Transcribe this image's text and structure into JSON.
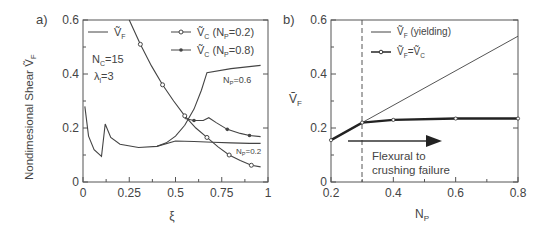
{
  "chart_data": [
    {
      "panel": "a)",
      "type": "line",
      "xlabel": "ξ",
      "ylabel": "Nondimesional Shear Ṽ_F",
      "xlim": [
        0,
        1
      ],
      "ylim": [
        0,
        0.6
      ],
      "xticks": [
        "0",
        "0.25",
        "0.5",
        "0.75",
        "1"
      ],
      "yticks": [
        "0",
        "0.2",
        "0.4",
        "0.6"
      ],
      "grid": false,
      "legend": [
        "Ṽ_F",
        "Ṽ_C (N_P=0.2)",
        "Ṽ_C (N_P=0.8)"
      ],
      "legend_position": "top",
      "annotations": [
        "N_C=15",
        "λ_l=3",
        "N_P=0.6",
        "N_P=0.2"
      ],
      "series": [
        {
          "name": "Ṽ_F (N_P=0.2)",
          "x": [
            0.01,
            0.03,
            0.06,
            0.1,
            0.12,
            0.15,
            0.2,
            0.3,
            0.4,
            0.5,
            0.6,
            0.7,
            0.8,
            0.9,
            0.96
          ],
          "y": [
            0.28,
            0.17,
            0.12,
            0.095,
            0.215,
            0.165,
            0.14,
            0.128,
            0.132,
            0.152,
            0.15,
            0.147,
            0.145,
            0.143,
            0.143
          ]
        },
        {
          "name": "Ṽ_F (N_P=0.6)",
          "x": [
            0.4,
            0.45,
            0.5,
            0.55,
            0.6,
            0.64,
            0.67,
            0.8,
            0.96
          ],
          "y": [
            0.132,
            0.145,
            0.17,
            0.21,
            0.27,
            0.34,
            0.405,
            0.42,
            0.432
          ]
        },
        {
          "name": "Ṽ_F (N_P=0.8)",
          "x": [
            0.55,
            0.6,
            0.65,
            0.68,
            0.72,
            0.78,
            0.85,
            0.9,
            0.96
          ],
          "y": [
            0.235,
            0.228,
            0.228,
            0.238,
            0.22,
            0.195,
            0.18,
            0.172,
            0.168
          ]
        },
        {
          "name": "Ṽ_C (N_P=0.2)",
          "x": [
            0.25,
            0.31,
            0.37,
            0.43,
            0.49,
            0.55,
            0.61,
            0.67,
            0.73,
            0.79,
            0.85,
            0.91,
            0.96
          ],
          "y": [
            0.6,
            0.51,
            0.43,
            0.36,
            0.3,
            0.245,
            0.2,
            0.165,
            0.13,
            0.1,
            0.08,
            0.062,
            0.056
          ]
        }
      ]
    },
    {
      "panel": "b)",
      "type": "line",
      "xlabel": "N_P",
      "ylabel": "Ṽ_F",
      "xlim": [
        0.2,
        0.8
      ],
      "ylim": [
        0,
        0.6
      ],
      "xticks": [
        "0.2",
        "0.4",
        "0.6",
        "0.8"
      ],
      "yticks": [
        "0",
        "0.2",
        "0.4",
        "0.6"
      ],
      "grid": false,
      "legend": [
        "Ṽ_F (yielding)",
        "Ṽ_F=Ṽ_C"
      ],
      "legend_position": "top-right",
      "vline_x": 0.3,
      "annotations": [
        "Flexural to",
        "crushing failure"
      ],
      "series": [
        {
          "name": "Ṽ_F (yielding)",
          "x": [
            0.2,
            0.3,
            0.8
          ],
          "y": [
            0.155,
            0.22,
            0.54
          ]
        },
        {
          "name": "Ṽ_F=Ṽ_C",
          "x": [
            0.2,
            0.3,
            0.4,
            0.6,
            0.8
          ],
          "y": [
            0.155,
            0.22,
            0.23,
            0.235,
            0.235
          ]
        }
      ]
    }
  ],
  "labels": {
    "panel_a": "a)",
    "panel_b": "b)",
    "a_ylabel": "Nondimesional Shear Ṽ",
    "a_ylabel_sub": "F",
    "a_xlabel": "ξ",
    "b_ylabel": "Ṽ",
    "b_ylabel_sub": "F",
    "b_xlabel": "N",
    "b_xlabel_sub": "P",
    "nc": "N",
    "nc_sub": "C",
    "nc_val": "=15",
    "lam": "λ",
    "lam_sub": "l",
    "lam_val": "=3",
    "np06": "N",
    "np06_sub": "P",
    "np06_val": "=0.6",
    "np02": "N",
    "np02_sub": "P",
    "np02_val": "=0.2",
    "leg_a1": "Ṽ",
    "leg_a1_sub": "F",
    "leg_a2": "Ṽ",
    "leg_a2_sub": "C",
    "leg_a2_rest": " (N",
    "leg_a2_sub2": "P",
    "leg_a2_end": "=0.2)",
    "leg_a3": "Ṽ",
    "leg_a3_sub": "C",
    "leg_a3_rest": " (N",
    "leg_a3_sub2": "P",
    "leg_a3_end": "=0.8)",
    "leg_b1": "Ṽ",
    "leg_b1_sub": "F",
    "leg_b1_rest": " (yielding)",
    "leg_b2": "Ṽ",
    "leg_b2_sub": "F",
    "leg_b2_mid": "=Ṽ",
    "leg_b2_sub2": "C",
    "ann1": "Flexural to",
    "ann2": "crushing failure"
  },
  "ticks_a_x": [
    "0",
    "0.25",
    "0.5",
    "0.75",
    "1"
  ],
  "ticks_y": [
    "0",
    "0.2",
    "0.4",
    "0.6"
  ],
  "ticks_b_x": [
    "0.2",
    "0.4",
    "0.6",
    "0.8"
  ]
}
